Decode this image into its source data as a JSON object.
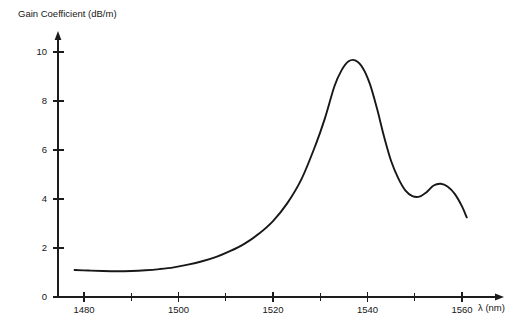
{
  "chart_data": {
    "type": "line",
    "title": "",
    "ylabel": "Gain Coefficient (dB/m)",
    "xlabel": "λ (nm)",
    "xlim": [
      1477,
      1565
    ],
    "ylim": [
      0,
      11
    ],
    "grid": false,
    "legend": null,
    "x_ticks_major": [
      1480,
      1500,
      1520,
      1540,
      1560
    ],
    "x_ticks_major_labels": [
      "1480",
      "1500",
      "1520",
      "1540",
      "1560"
    ],
    "x_ticks_minor": [
      1490,
      1510,
      1530,
      1550
    ],
    "y_ticks": [
      0,
      2,
      4,
      6,
      8,
      10
    ],
    "y_tick_labels": [
      "0",
      "2",
      "4",
      "6",
      "8",
      "10"
    ],
    "series": [
      {
        "name": "Erbium gain coefficient",
        "x": [
          1478.0,
          1481.0,
          1484.0,
          1487.0,
          1490.0,
          1493.0,
          1496.0,
          1499.0,
          1502.0,
          1505.0,
          1508.0,
          1511.0,
          1514.0,
          1517.0,
          1520.0,
          1523.0,
          1526.0,
          1529.0,
          1531.0,
          1533.0,
          1534.5,
          1536.0,
          1537.5,
          1539.0,
          1540.5,
          1542.0,
          1543.5,
          1545.0,
          1546.5,
          1548.0,
          1549.5,
          1551.0,
          1552.5,
          1554.0,
          1555.5,
          1557.0,
          1558.5,
          1560.0,
          1561.0
        ],
        "y": [
          1.1,
          1.08,
          1.06,
          1.05,
          1.06,
          1.09,
          1.14,
          1.21,
          1.32,
          1.46,
          1.64,
          1.88,
          2.18,
          2.58,
          3.1,
          3.82,
          4.8,
          6.2,
          7.3,
          8.6,
          9.25,
          9.62,
          9.65,
          9.35,
          8.7,
          7.7,
          6.55,
          5.55,
          4.85,
          4.35,
          4.12,
          4.1,
          4.28,
          4.55,
          4.62,
          4.5,
          4.2,
          3.7,
          3.25
        ]
      }
    ],
    "annotations": []
  },
  "colors": {
    "curve": "#181818",
    "axis": "#1c1c1c",
    "text": "#161616",
    "background": "#ffffff"
  }
}
